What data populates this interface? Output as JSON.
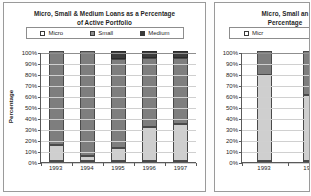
{
  "chart_data": [
    {
      "id": "left",
      "type": "bar",
      "subtype": "stacked-100-percent",
      "title": "Micro, Small & Medium Loans as a Percentage of Active Portfolio",
      "title_line1": "Micro, Small & Medium Loans as a Percentage",
      "title_line2": "of Active Portfolio",
      "xlabel": "",
      "ylabel": "Percentage",
      "ylim": [
        0,
        100
      ],
      "ytick_labels": [
        "100%",
        "90%",
        "80%",
        "70%",
        "60%",
        "50%",
        "40%",
        "30%",
        "20%",
        "10%",
        "0%"
      ],
      "ytick_values": [
        100,
        90,
        80,
        70,
        60,
        50,
        40,
        30,
        20,
        10,
        0
      ],
      "grid": true,
      "legend_position": "top",
      "categories": [
        "1993",
        "1994",
        "1995",
        "1996",
        "1997"
      ],
      "series": [
        {
          "name": "Micro",
          "color": "#cfcfcf",
          "values": [
            15,
            5,
            12,
            31,
            34
          ]
        },
        {
          "name": "Small",
          "color": "#7e7e7e",
          "values": [
            85,
            95,
            81,
            63,
            60
          ]
        },
        {
          "name": "Medium",
          "color": "#3c3c3c",
          "values": [
            0,
            0,
            7,
            6,
            6
          ]
        }
      ]
    },
    {
      "id": "right",
      "type": "bar",
      "subtype": "stacked-100-percent",
      "title": "Micro, Small and Medium ... Percentage ...",
      "title_line1": "Micro, Small an",
      "title_line2": "Percentage",
      "xlabel": "",
      "ylabel": "",
      "ylim": [
        0,
        100
      ],
      "ytick_labels": [
        "100%",
        "90%",
        "80%",
        "70%",
        "60%",
        "50%",
        "40%",
        "30%",
        "20%",
        "10%",
        "0%"
      ],
      "ytick_values": [
        100,
        90,
        80,
        70,
        60,
        50,
        40,
        30,
        20,
        10,
        0
      ],
      "grid": true,
      "legend_position": "top",
      "categories": [
        "1993",
        "1994"
      ],
      "series": [
        {
          "name": "Micro",
          "color": "#cfcfcf",
          "values": [
            78,
            60
          ]
        },
        {
          "name": "Small",
          "color": "#7e7e7e",
          "values": [
            22,
            40
          ]
        },
        {
          "name": "Medium",
          "color": "#3c3c3c",
          "values": [
            0,
            0
          ]
        }
      ]
    }
  ],
  "left_panel": {
    "title_line1": "Micro, Small & Medium Loans as a Percentage",
    "title_line2": "of Active Portfolio",
    "ylabel": "Percentage",
    "legend": [
      {
        "label": "Micro",
        "swatch": "swatch-micro-icon"
      },
      {
        "label": "Small",
        "swatch": "swatch-small-icon"
      },
      {
        "label": "Medium",
        "swatch": "swatch-medium-icon"
      }
    ]
  },
  "right_panel": {
    "title_line1": "Micro, Small an",
    "title_line2": "Percentage",
    "legend": [
      {
        "label": "Micr",
        "swatch": "swatch-micro-icon"
      }
    ]
  }
}
